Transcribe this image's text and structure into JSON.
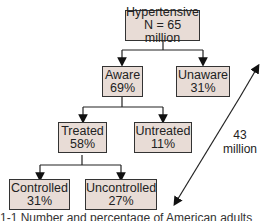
{
  "nodes": {
    "root": {
      "line1": "Hypertensive",
      "line2": "N = 65 million"
    },
    "aware": {
      "line1": "Aware",
      "line2": "69%"
    },
    "unaware": {
      "line1": "Unaware",
      "line2": "31%"
    },
    "treated": {
      "line1": "Treated",
      "line2": "58%"
    },
    "untreated": {
      "line1": "Untreated",
      "line2": "11%"
    },
    "controlled": {
      "line1": "Controlled",
      "line2": "31%"
    },
    "uncontrolled": {
      "line1": "Uncontrolled",
      "line2": "27%"
    }
  },
  "arrow_label": {
    "line1": "43",
    "line2": "million"
  },
  "caption": "1-1   Number and percentage of American adults"
}
